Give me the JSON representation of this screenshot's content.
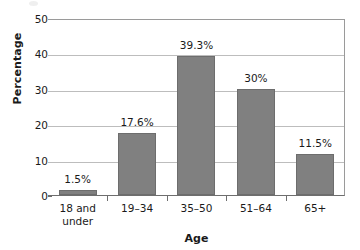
{
  "chart_data": {
    "type": "bar",
    "title": "",
    "xlabel": "Age",
    "ylabel": "Percentage",
    "categories": [
      "18 and under",
      "19–34",
      "35–50",
      "51–64",
      "65+"
    ],
    "category_lines": [
      [
        "18 and",
        "under"
      ],
      [
        "19–34"
      ],
      [
        "35–50"
      ],
      [
        "51–64"
      ],
      [
        "65+"
      ]
    ],
    "values": [
      1.5,
      17.6,
      39.3,
      30,
      11.5
    ],
    "data_labels": [
      "1.5%",
      "17.6%",
      "39.3%",
      "30%",
      "11.5%"
    ],
    "ylim": [
      0,
      50
    ],
    "yticks": [
      0,
      10,
      20,
      30,
      40,
      50
    ],
    "ytick_labels": [
      "0",
      "10",
      "20",
      "30",
      "40",
      "50"
    ],
    "grid": "horizontal",
    "legend": "none",
    "bar_color": "#808080",
    "bar_border_color": "#6d6d6d",
    "gridline_color": "#bdbdbd",
    "axis_color": "#6e6e6e",
    "background": "#ffffff",
    "text_color": "#1a1a1a"
  }
}
